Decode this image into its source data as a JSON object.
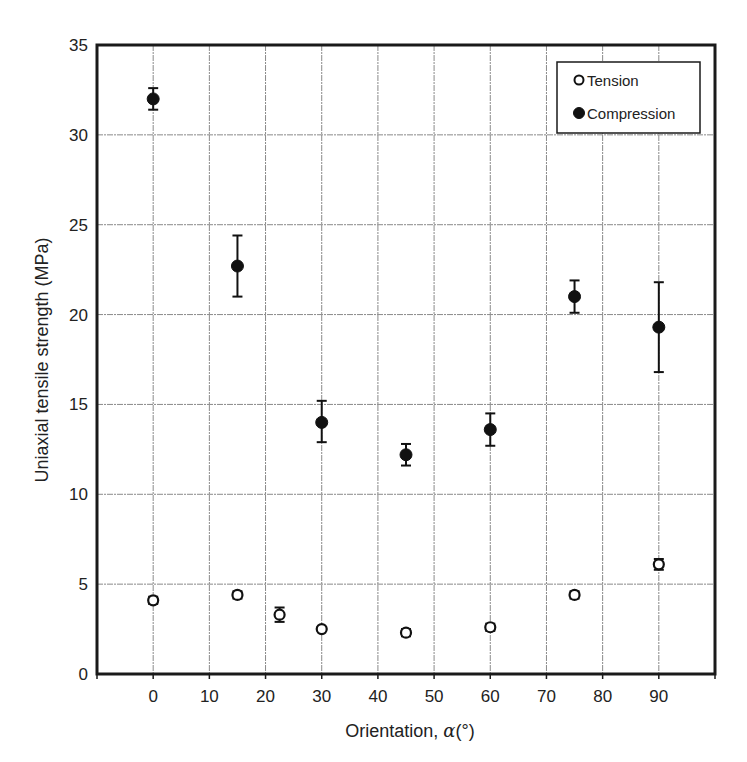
{
  "chart_data": {
    "type": "scatter",
    "title": "",
    "xlabel": "Orientation, α(°)",
    "xlabel_main": "Orientation, ",
    "xlabel_symbol": "α",
    "xlabel_unit": "(°)",
    "ylabel": "Uniaxial tensile strength (MPa)",
    "xlim": [
      -10,
      100
    ],
    "ylim": [
      0,
      35
    ],
    "xticks": [
      0,
      10,
      20,
      30,
      40,
      50,
      60,
      70,
      80,
      90
    ],
    "yticks": [
      0,
      5,
      10,
      15,
      20,
      25,
      30,
      35
    ],
    "grid": true,
    "legend_position": "upper right",
    "series": [
      {
        "name": "Tension",
        "marker": "open-circle",
        "x": [
          0,
          15,
          22.5,
          30,
          45,
          60,
          75,
          90
        ],
        "y": [
          4.1,
          4.4,
          3.3,
          2.5,
          2.3,
          2.6,
          4.4,
          6.1
        ],
        "err_low": [
          3.9,
          4.2,
          2.9,
          2.4,
          2.1,
          2.4,
          4.2,
          5.8
        ],
        "err_high": [
          4.3,
          4.6,
          3.7,
          2.6,
          2.5,
          2.8,
          4.6,
          6.4
        ]
      },
      {
        "name": "Compression",
        "marker": "filled-circle",
        "x": [
          0,
          15,
          30,
          45,
          60,
          75,
          90
        ],
        "y": [
          32.0,
          22.7,
          14.0,
          12.2,
          13.6,
          21.0,
          19.3
        ],
        "err_low": [
          31.4,
          21.0,
          12.9,
          11.6,
          12.7,
          20.1,
          16.8
        ],
        "err_high": [
          32.6,
          24.4,
          15.2,
          12.8,
          14.5,
          21.9,
          21.8
        ]
      }
    ]
  },
  "legend": {
    "items": [
      {
        "label": "Tension",
        "marker": "open-circle"
      },
      {
        "label": "Compression",
        "marker": "filled-circle"
      }
    ]
  },
  "colors": {
    "frame": "#1a1a1a",
    "grid": "#8a8a8a",
    "marker": "#111111",
    "text": "#222222",
    "background": "#ffffff"
  }
}
